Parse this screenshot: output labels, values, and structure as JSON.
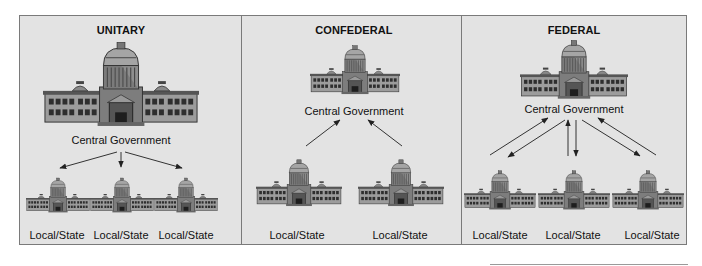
{
  "panels": [
    {
      "title": "UNITARY",
      "central_label": "Central Government",
      "local_labels": [
        "Local/State",
        "Local/State",
        "Local/State"
      ],
      "relationship": "central-to-local arrows"
    },
    {
      "title": "CONFEDERAL",
      "central_label": "Central Government",
      "local_labels": [
        "Local/State",
        "Local/State"
      ],
      "relationship": "local-to-central arrows"
    },
    {
      "title": "FEDERAL",
      "central_label": "Central Government",
      "local_labels": [
        "Local/State",
        "Local/State",
        "Local/State"
      ],
      "relationship": "bidirectional arrows"
    }
  ],
  "icons": {
    "building": "capitol-building-icon"
  },
  "colors": {
    "panel_bg": "#e3e3e3",
    "border": "#7a7a7a",
    "text": "#111111",
    "arrow": "#333333"
  }
}
